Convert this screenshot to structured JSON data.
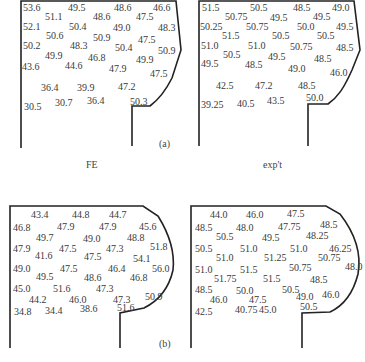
{
  "captions": {
    "left": "FE",
    "right": "exp't"
  },
  "panel_labels": {
    "a": "(a)",
    "b": "(b)"
  },
  "panels": {
    "a_fe": [
      {
        "v": "53.6",
        "x": 23,
        "y": 3
      },
      {
        "v": "49.5",
        "x": 68,
        "y": 3
      },
      {
        "v": "48.6",
        "x": 114,
        "y": 3
      },
      {
        "v": "46.6",
        "x": 153,
        "y": 3
      },
      {
        "v": "51.1",
        "x": 45,
        "y": 12
      },
      {
        "v": "48.6",
        "x": 93,
        "y": 12
      },
      {
        "v": "47.5",
        "x": 136,
        "y": 12
      },
      {
        "v": "52.1",
        "x": 23,
        "y": 22
      },
      {
        "v": "50.4",
        "x": 69,
        "y": 22
      },
      {
        "v": "49.0",
        "x": 113,
        "y": 23
      },
      {
        "v": "48.3",
        "x": 158,
        "y": 23
      },
      {
        "v": "50.6",
        "x": 46,
        "y": 31
      },
      {
        "v": "50.9",
        "x": 93,
        "y": 33
      },
      {
        "v": "47.5",
        "x": 138,
        "y": 35
      },
      {
        "v": "50.2",
        "x": 23,
        "y": 41
      },
      {
        "v": "48.3",
        "x": 70,
        "y": 41
      },
      {
        "v": "50.4",
        "x": 115,
        "y": 43
      },
      {
        "v": "50.9",
        "x": 158,
        "y": 46
      },
      {
        "v": "49.9",
        "x": 45,
        "y": 51
      },
      {
        "v": "46.8",
        "x": 88,
        "y": 53
      },
      {
        "v": "49.9",
        "x": 136,
        "y": 55
      },
      {
        "v": "43.6",
        "x": 22,
        "y": 62
      },
      {
        "v": "44.6",
        "x": 65,
        "y": 61
      },
      {
        "v": "47.9",
        "x": 109,
        "y": 64
      },
      {
        "v": "47.5",
        "x": 150,
        "y": 69
      },
      {
        "v": "36.4",
        "x": 41,
        "y": 83
      },
      {
        "v": "39.9",
        "x": 77,
        "y": 83
      },
      {
        "v": "47.2",
        "x": 118,
        "y": 82
      },
      {
        "v": "30.5",
        "x": 24,
        "y": 102
      },
      {
        "v": "30.7",
        "x": 55,
        "y": 98
      },
      {
        "v": "36.4",
        "x": 87,
        "y": 96
      },
      {
        "v": "50.3",
        "x": 130,
        "y": 97
      }
    ],
    "a_exp": [
      {
        "v": "51.5",
        "x": 202,
        "y": 3
      },
      {
        "v": "50.5",
        "x": 250,
        "y": 3
      },
      {
        "v": "48.5",
        "x": 293,
        "y": 3
      },
      {
        "v": "49.0",
        "x": 332,
        "y": 3
      },
      {
        "v": "50.75",
        "x": 225,
        "y": 12
      },
      {
        "v": "49.5",
        "x": 270,
        "y": 13
      },
      {
        "v": "49.5",
        "x": 313,
        "y": 12
      },
      {
        "v": "50.25",
        "x": 200,
        "y": 22
      },
      {
        "v": "50.75",
        "x": 246,
        "y": 22
      },
      {
        "v": "50.0",
        "x": 297,
        "y": 22
      },
      {
        "v": "49.5",
        "x": 336,
        "y": 22
      },
      {
        "v": "51.5",
        "x": 222,
        "y": 31
      },
      {
        "v": "50.5",
        "x": 272,
        "y": 31
      },
      {
        "v": "50.5",
        "x": 317,
        "y": 31
      },
      {
        "v": "51.0",
        "x": 201,
        "y": 41
      },
      {
        "v": "51.0",
        "x": 248,
        "y": 41
      },
      {
        "v": "50.75",
        "x": 290,
        "y": 42
      },
      {
        "v": "48.5",
        "x": 336,
        "y": 43
      },
      {
        "v": "50.5",
        "x": 223,
        "y": 50
      },
      {
        "v": "49.5",
        "x": 268,
        "y": 52
      },
      {
        "v": "48.5",
        "x": 314,
        "y": 54
      },
      {
        "v": "49.5",
        "x": 201,
        "y": 59
      },
      {
        "v": "48.5",
        "x": 245,
        "y": 60
      },
      {
        "v": "49.0",
        "x": 288,
        "y": 64
      },
      {
        "v": "46.0",
        "x": 330,
        "y": 68
      },
      {
        "v": "42.5",
        "x": 216,
        "y": 81
      },
      {
        "v": "47.2",
        "x": 255,
        "y": 81
      },
      {
        "v": "48.5",
        "x": 298,
        "y": 81
      },
      {
        "v": "39.25",
        "x": 201,
        "y": 100
      },
      {
        "v": "40.5",
        "x": 237,
        "y": 99
      },
      {
        "v": "43.5",
        "x": 267,
        "y": 96
      },
      {
        "v": "50.0",
        "x": 306,
        "y": 93
      }
    ],
    "b_fe": [
      {
        "v": "43.4",
        "x": 31,
        "y": 210
      },
      {
        "v": "44.8",
        "x": 72,
        "y": 210
      },
      {
        "v": "44.7",
        "x": 109,
        "y": 210
      },
      {
        "v": "46.8",
        "x": 13,
        "y": 223
      },
      {
        "v": "47.9",
        "x": 57,
        "y": 222
      },
      {
        "v": "47.9",
        "x": 99,
        "y": 222
      },
      {
        "v": "45.6",
        "x": 139,
        "y": 222
      },
      {
        "v": "49.7",
        "x": 36,
        "y": 233
      },
      {
        "v": "49.0",
        "x": 83,
        "y": 234
      },
      {
        "v": "48.8",
        "x": 127,
        "y": 233
      },
      {
        "v": "47.9",
        "x": 13,
        "y": 244
      },
      {
        "v": "47.5",
        "x": 59,
        "y": 244
      },
      {
        "v": "47.3",
        "x": 106,
        "y": 244
      },
      {
        "v": "51.8",
        "x": 150,
        "y": 242
      },
      {
        "v": "41.6",
        "x": 35,
        "y": 251
      },
      {
        "v": "47.5",
        "x": 84,
        "y": 252
      },
      {
        "v": "54.1",
        "x": 133,
        "y": 254
      },
      {
        "v": "49.0",
        "x": 13,
        "y": 264
      },
      {
        "v": "47.5",
        "x": 60,
        "y": 264
      },
      {
        "v": "46.4",
        "x": 108,
        "y": 264
      },
      {
        "v": "56.0",
        "x": 152,
        "y": 264
      },
      {
        "v": "49.5",
        "x": 36,
        "y": 272
      },
      {
        "v": "48.6",
        "x": 84,
        "y": 273
      },
      {
        "v": "46.8",
        "x": 130,
        "y": 273
      },
      {
        "v": "45.0",
        "x": 13,
        "y": 284
      },
      {
        "v": "51.6",
        "x": 53,
        "y": 284
      },
      {
        "v": "47.3",
        "x": 96,
        "y": 284
      },
      {
        "v": "44.2",
        "x": 29,
        "y": 295
      },
      {
        "v": "46.0",
        "x": 69,
        "y": 295
      },
      {
        "v": "47.3",
        "x": 113,
        "y": 295
      },
      {
        "v": "50.9",
        "x": 145,
        "y": 292
      },
      {
        "v": "34.8",
        "x": 14,
        "y": 307
      },
      {
        "v": "34.4",
        "x": 45,
        "y": 306
      },
      {
        "v": "38.6",
        "x": 80,
        "y": 304
      },
      {
        "v": "51.6",
        "x": 117,
        "y": 303
      }
    ],
    "b_exp": [
      {
        "v": "44.0",
        "x": 210,
        "y": 210
      },
      {
        "v": "46.0",
        "x": 246,
        "y": 210
      },
      {
        "v": "47.5",
        "x": 287,
        "y": 209
      },
      {
        "v": "48.5",
        "x": 195,
        "y": 223
      },
      {
        "v": "48.0",
        "x": 236,
        "y": 223
      },
      {
        "v": "47.75",
        "x": 278,
        "y": 222
      },
      {
        "v": "48.5",
        "x": 320,
        "y": 220
      },
      {
        "v": "50.5",
        "x": 216,
        "y": 232
      },
      {
        "v": "49.5",
        "x": 262,
        "y": 233
      },
      {
        "v": "48.25",
        "x": 306,
        "y": 231
      },
      {
        "v": "50.5",
        "x": 195,
        "y": 244
      },
      {
        "v": "51.0",
        "x": 240,
        "y": 244
      },
      {
        "v": "51.0",
        "x": 290,
        "y": 244
      },
      {
        "v": "46.25",
        "x": 329,
        "y": 244
      },
      {
        "v": "51.0",
        "x": 216,
        "y": 253
      },
      {
        "v": "51.25",
        "x": 264,
        "y": 253
      },
      {
        "v": "50.75",
        "x": 318,
        "y": 253
      },
      {
        "v": "51.0",
        "x": 195,
        "y": 265
      },
      {
        "v": "51.5",
        "x": 240,
        "y": 265
      },
      {
        "v": "50.75",
        "x": 289,
        "y": 263
      },
      {
        "v": "48.0",
        "x": 345,
        "y": 262
      },
      {
        "v": "51.75",
        "x": 214,
        "y": 274
      },
      {
        "v": "51.5",
        "x": 263,
        "y": 274
      },
      {
        "v": "48.5",
        "x": 310,
        "y": 275
      },
      {
        "v": "48.5",
        "x": 195,
        "y": 285
      },
      {
        "v": "50.0",
        "x": 236,
        "y": 286
      },
      {
        "v": "50.5",
        "x": 282,
        "y": 285
      },
      {
        "v": "46.0",
        "x": 210,
        "y": 295
      },
      {
        "v": "47.5",
        "x": 249,
        "y": 295
      },
      {
        "v": "49.0",
        "x": 296,
        "y": 292
      },
      {
        "v": "46.0",
        "x": 322,
        "y": 290
      },
      {
        "v": "42.5",
        "x": 195,
        "y": 307
      },
      {
        "v": "40.75",
        "x": 235,
        "y": 305
      },
      {
        "v": "45.0",
        "x": 259,
        "y": 305
      },
      {
        "v": "50.5",
        "x": 300,
        "y": 302
      }
    ]
  }
}
